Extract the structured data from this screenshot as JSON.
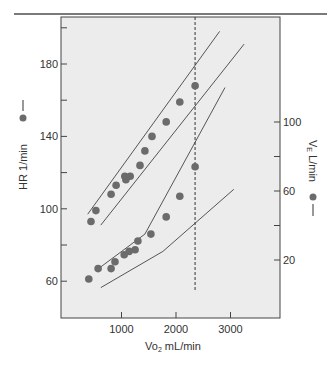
{
  "chart_data": {
    "type": "scatter",
    "title": "",
    "xlabel": "Vo2 mL/min",
    "xlabel_main": "Vo",
    "xlabel_sub": "2",
    "xlabel_unit": " mL/min",
    "ylabel_left": "HR 1/min",
    "ylabel_right": "VE L/min",
    "ylabel_right_main": "V",
    "ylabel_right_sub": "E",
    "ylabel_right_unit": " L/min",
    "xlim": [
      0,
      3900
    ],
    "ylim_left": [
      40,
      208
    ],
    "ylim_right": [
      -10,
      113
    ],
    "x_ticks": [
      1000,
      2000,
      3000
    ],
    "x_tick_labels": [
      "1000",
      "2000",
      "3000"
    ],
    "y_left_ticks": [
      60,
      80,
      100,
      120,
      140,
      160,
      180,
      200
    ],
    "y_left_tick_labels": [
      "60",
      "",
      "100",
      "",
      "140",
      "",
      "180",
      ""
    ],
    "y_right_ticks": [
      20,
      40,
      60,
      80,
      100
    ],
    "y_right_tick_labels": [
      "20",
      "",
      "60",
      "",
      "100"
    ],
    "grid": false,
    "background": "#ececec",
    "marker_color": "#6b6b6b",
    "vertical_marker": {
      "x": 2350,
      "style": "dashed",
      "label": "anaerobic threshold"
    },
    "series": [
      {
        "name": "HR",
        "axis": "left",
        "marker": "filled-circle",
        "points": [
          [
            440,
            93
          ],
          [
            530,
            99
          ],
          [
            810,
            108
          ],
          [
            900,
            113
          ],
          [
            1060,
            118
          ],
          [
            1080,
            116
          ],
          [
            1160,
            118
          ],
          [
            1340,
            124
          ],
          [
            1430,
            132
          ],
          [
            1560,
            140
          ],
          [
            1820,
            148
          ],
          [
            2070,
            159
          ],
          [
            2350,
            168
          ]
        ]
      },
      {
        "name": "VE",
        "axis": "right",
        "marker": "filled-circle",
        "points": [
          [
            400,
            9
          ],
          [
            570,
            15
          ],
          [
            810,
            15
          ],
          [
            880,
            19
          ],
          [
            1050,
            23
          ],
          [
            1140,
            25
          ],
          [
            1250,
            26
          ],
          [
            1300,
            31
          ],
          [
            1540,
            35
          ],
          [
            1820,
            45
          ],
          [
            2070,
            57
          ],
          [
            2350,
            74
          ]
        ]
      }
    ],
    "reference_bands": [
      {
        "name": "HR upper limit",
        "axis": "left",
        "points": [
          [
            380,
            97
          ],
          [
            2800,
            198
          ]
        ]
      },
      {
        "name": "HR lower limit",
        "axis": "left",
        "points": [
          [
            620,
            91
          ],
          [
            3250,
            191
          ]
        ]
      },
      {
        "name": "VE upper limit",
        "axis": "right",
        "points": [
          [
            620,
            16
          ],
          [
            1430,
            35
          ],
          [
            2900,
            120
          ]
        ]
      },
      {
        "name": "VE lower limit",
        "axis": "right",
        "points": [
          [
            620,
            4
          ],
          [
            1760,
            25
          ],
          [
            3060,
            61
          ]
        ]
      }
    ]
  },
  "legend": {
    "hr_marker_text": "HR 1/min",
    "ve_marker_text": "VE L/min"
  }
}
